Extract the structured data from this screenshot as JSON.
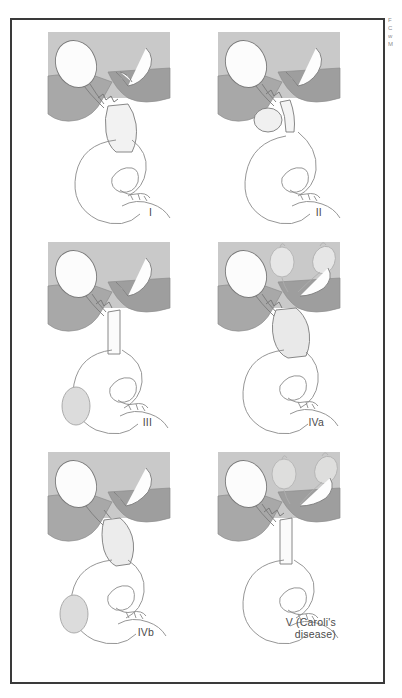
{
  "figure": {
    "panel_count": 6,
    "frame_color": "#3a3a3a",
    "background": "#ffffff"
  },
  "palette": {
    "liver_light": "#c9c9c9",
    "liver_mid": "#b1b1b1",
    "liver_dark": "#9a9a9a",
    "duct_white": "#fdfdfd",
    "duct_shade": "#e4e4e4",
    "cyst_fill": "#dcdcdc",
    "outline": "#6e6e6e",
    "label_text": "#4b4b4b"
  },
  "edge_note": {
    "line1": "F",
    "line2": "C",
    "line3": "w",
    "line4": "M"
  },
  "panels": [
    {
      "id": "type-1",
      "label": "I",
      "index": 0,
      "description": "Fusiform dilation of the extrahepatic common bile duct",
      "features": [
        "gallbladder",
        "liver",
        "common-bile-duct-fusiform-dilation",
        "duodenum",
        "pancreatic-duct"
      ]
    },
    {
      "id": "type-2",
      "label": "II",
      "index": 1,
      "description": "Diverticulum of the extrahepatic bile duct",
      "features": [
        "gallbladder",
        "liver",
        "bile-duct-diverticulum",
        "duodenum",
        "pancreatic-duct"
      ]
    },
    {
      "id": "type-3",
      "label": "III",
      "index": 2,
      "description": "Choledochocele, cystic dilation within the duodenal wall",
      "features": [
        "gallbladder",
        "liver",
        "choledochocele",
        "duodenum",
        "pancreatic-duct"
      ]
    },
    {
      "id": "type-4a",
      "label": "IVa",
      "index": 3,
      "description": "Multiple intrahepatic and extrahepatic duct dilations",
      "features": [
        "gallbladder",
        "liver",
        "intrahepatic-cysts",
        "extrahepatic-dilation",
        "duodenum",
        "pancreatic-duct"
      ]
    },
    {
      "id": "type-4b",
      "label": "IVb",
      "index": 4,
      "description": "Multiple extrahepatic duct dilations with choledochocele",
      "features": [
        "gallbladder",
        "liver",
        "extrahepatic-dilation",
        "choledochocele",
        "duodenum",
        "pancreatic-duct"
      ]
    },
    {
      "id": "type-5",
      "label": "V (Caroli's\ndisease)",
      "index": 5,
      "description": "Intrahepatic duct dilations only — Caroli's disease",
      "features": [
        "gallbladder",
        "liver",
        "intrahepatic-cysts",
        "duodenum",
        "pancreatic-duct"
      ]
    }
  ]
}
